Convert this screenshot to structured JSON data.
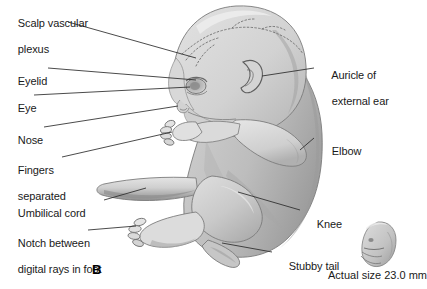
{
  "figure": {
    "panel_letter": "B",
    "actual_size_caption": "Actual size 23.0 mm"
  },
  "labels": {
    "left": [
      {
        "id": "scalp-vascular-plexus",
        "line1": "Scalp vascular",
        "line2": "plexus",
        "x": 6,
        "y": 4,
        "two_line": true
      },
      {
        "id": "eyelid",
        "line1": "Eyelid",
        "line2": "",
        "x": 6,
        "y": 62,
        "two_line": false
      },
      {
        "id": "eye",
        "line1": "Eye",
        "line2": "",
        "x": 6,
        "y": 89,
        "two_line": false
      },
      {
        "id": "nose",
        "line1": "Nose",
        "line2": "",
        "x": 6,
        "y": 121,
        "two_line": false
      },
      {
        "id": "fingers-separated",
        "line1": "Fingers",
        "line2": "separated",
        "x": 6,
        "y": 151,
        "two_line": true
      },
      {
        "id": "umbilical-cord",
        "line1": "Umbilical cord",
        "line2": "",
        "x": 6,
        "y": 194,
        "two_line": false
      },
      {
        "id": "notch-digital-rays-foot",
        "line1": "Notch between",
        "line2": "digital rays in foot",
        "x": 6,
        "y": 224,
        "two_line": true
      }
    ],
    "right": [
      {
        "id": "auricle-external-ear",
        "line1": "Auricle of",
        "line2": "external ear",
        "x": 320,
        "y": 56,
        "two_line": true
      },
      {
        "id": "elbow",
        "line1": "Elbow",
        "line2": "",
        "x": 320,
        "y": 132,
        "two_line": false
      },
      {
        "id": "knee",
        "line1": "Knee",
        "line2": "",
        "x": 305,
        "y": 205,
        "two_line": false
      },
      {
        "id": "stubby-tail",
        "line1": "Stubby tail",
        "line2": "",
        "x": 277,
        "y": 247,
        "two_line": false
      }
    ]
  },
  "colors": {
    "background": "#ffffff",
    "body_light": "#d9d9d9",
    "body_mid": "#c4c4c4",
    "body_shadow": "#a8a8a8",
    "body_dark": "#8e8e8e",
    "outline": "#6b6b6b",
    "leader_line": "#2b2b2b",
    "text": "#1a1a1a",
    "highlight": "#ececec"
  }
}
